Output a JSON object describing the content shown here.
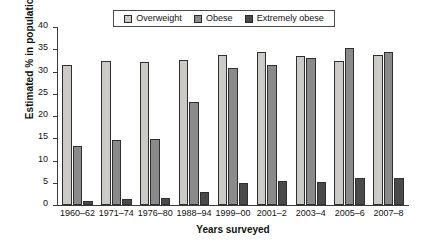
{
  "chart_data": {
    "type": "bar",
    "title": "",
    "xlabel": "Years surveyed",
    "ylabel": "Estimated % in population",
    "ylim": [
      0,
      40
    ],
    "yticks": [
      0,
      5,
      10,
      15,
      20,
      25,
      30,
      35,
      40
    ],
    "grid": false,
    "legend_position": "top-center",
    "categories": [
      "1960–62",
      "1971–74",
      "1976–80",
      "1988–94",
      "1999–00",
      "2001–2",
      "2003–4",
      "2005–6",
      "2007–8"
    ],
    "series": [
      {
        "name": "Overweight",
        "color": "#cccac6",
        "values": [
          31.5,
          32.3,
          32.1,
          32.7,
          33.7,
          34.4,
          33.5,
          32.3,
          33.8
        ]
      },
      {
        "name": "Obese",
        "color": "#8a8a8a",
        "values": [
          13.3,
          14.5,
          14.9,
          23.2,
          30.8,
          31.4,
          33.0,
          35.2,
          34.4
        ]
      },
      {
        "name": "Extremely obese",
        "color": "#4a4a4a",
        "values": [
          0.9,
          1.3,
          1.5,
          3.0,
          5.0,
          5.4,
          5.1,
          6.1,
          6.0
        ]
      }
    ]
  },
  "legend": {
    "items": [
      {
        "label": "Overweight",
        "color": "#cccac6"
      },
      {
        "label": "Obese",
        "color": "#8a8a8a"
      },
      {
        "label": "Extremely obese",
        "color": "#4a4a4a"
      }
    ]
  }
}
